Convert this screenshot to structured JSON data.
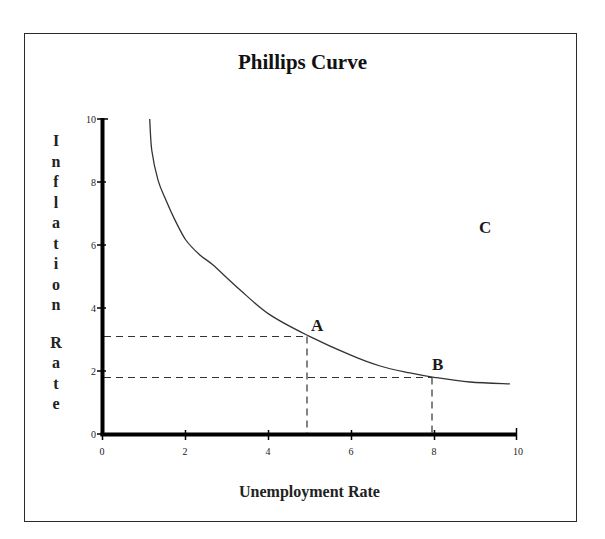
{
  "chart_data": {
    "type": "line",
    "title": "Phillips Curve",
    "xlabel": "Unemployment Rate",
    "ylabel": "Inflation Rate",
    "xlim": [
      0,
      10
    ],
    "ylim": [
      0,
      10
    ],
    "xticks": [
      0,
      2,
      4,
      6,
      8,
      10
    ],
    "yticks": [
      0,
      2,
      4,
      6,
      8,
      10
    ],
    "grid": false,
    "legend": null,
    "series": [
      {
        "name": "Phillips Curve",
        "x": [
          1.15,
          1.2,
          1.35,
          1.54,
          1.76,
          2.02,
          2.36,
          2.67,
          3.33,
          4.05,
          5.0,
          5.98,
          6.7,
          7.42,
          8.0,
          8.87,
          9.83
        ],
        "y": [
          10.0,
          9.0,
          8.06,
          7.43,
          6.79,
          6.16,
          5.68,
          5.37,
          4.57,
          3.78,
          3.1,
          2.51,
          2.16,
          1.94,
          1.8,
          1.65,
          1.59
        ]
      }
    ],
    "annotations": [
      {
        "label": "A",
        "x": 5,
        "y": 3.1,
        "guides": "dashed lines to both axes"
      },
      {
        "label": "B",
        "x": 8,
        "y": 1.8,
        "guides": "dashed lines to both axes"
      },
      {
        "label": "C",
        "x": 9.2,
        "y": 6.6,
        "guides": "none (point off the curve)"
      }
    ]
  },
  "figure": {
    "title": "Phillips Curve",
    "xlabel": "Unemployment Rate",
    "ylabel_word1": [
      "I",
      "n",
      "f",
      "l",
      "a",
      "t",
      "i",
      "o",
      "n"
    ],
    "ylabel_word2": [
      "R",
      "a",
      "t",
      "e"
    ],
    "xtick_labels": [
      "0",
      "2",
      "4",
      "6",
      "8",
      "10"
    ],
    "ytick_labels": [
      "0",
      "2",
      "4",
      "6",
      "8",
      "10"
    ],
    "points": {
      "a": "A",
      "b": "B",
      "c": "C"
    },
    "colors": {
      "axis": "#000000",
      "curve": "#333333",
      "dashed": "#333333",
      "frame": "#2a2a2a",
      "text": "#222222"
    }
  }
}
